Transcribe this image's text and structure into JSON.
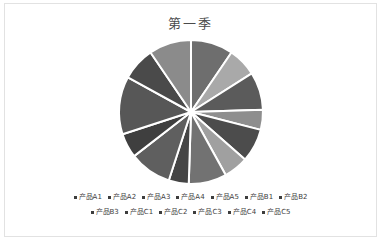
{
  "chart_data": {
    "type": "pie",
    "title": "第一季",
    "xlabel": "",
    "ylabel": "",
    "legend_position": "bottom",
    "grid": false,
    "start_angle": 0,
    "categories": [
      "产品A1",
      "产品A2",
      "产品A3",
      "产品A4",
      "产品A5",
      "产品B1",
      "产品B2",
      "产品B3",
      "产品C1",
      "产品C2",
      "产品C3",
      "产品C4",
      "产品C5"
    ],
    "values": [
      9.5,
      6.5,
      8.5,
      4.5,
      7.5,
      5.5,
      8.5,
      4.5,
      9.5,
      5.5,
      13.0,
      7.5,
      9.5
    ],
    "colors": [
      "#6e6e6e",
      "#a9a9a9",
      "#5b5b5b",
      "#8e8e8e",
      "#4c4c4c",
      "#a0a0a0",
      "#727272",
      "#454545",
      "#5f5f5f",
      "#3f3f3f",
      "#575757",
      "#4a4a4a",
      "#8b8b8b"
    ],
    "slice_gap_color": "#ffffff",
    "radius": 72,
    "center": [
      186,
      74
    ]
  },
  "frame": {
    "border_color": "#e2e2e2",
    "background": "#ffffff"
  },
  "legend": {
    "marker_color": "#3d3d3d",
    "rows": [
      [
        "产品A1",
        "产品A2",
        "产品A3",
        "产品A4",
        "产品A5",
        "产品B1",
        "产品B2"
      ],
      [
        "产品B3",
        "产品C1",
        "产品C2",
        "产品C3",
        "产品C4",
        "产品C5"
      ]
    ]
  }
}
